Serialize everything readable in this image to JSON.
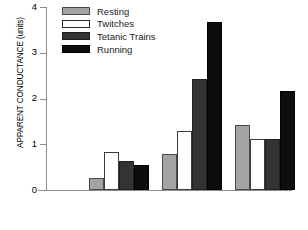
{
  "chart_data": {
    "type": "bar",
    "title": "",
    "xlabel": "",
    "ylabel": "APPARENT CONDUCTANCE (units)",
    "ylim": [
      0,
      4
    ],
    "yticks": [
      0,
      1,
      2,
      3,
      4
    ],
    "ytick_labels": [
      "0",
      "1",
      "2",
      "3",
      "4"
    ],
    "xtick_labels": [
      "",
      "",
      ""
    ],
    "grid": false,
    "legend_position": "top-center",
    "categories": [
      "Group 1",
      "Group 2",
      "Group 3"
    ],
    "series": [
      {
        "name": "Resting",
        "color": "#a3a3a3",
        "values": [
          0.26,
          0.79,
          1.43
        ]
      },
      {
        "name": "Twitches",
        "color": "#ffffff",
        "values": [
          0.83,
          1.29,
          1.12
        ]
      },
      {
        "name": "Tetanic Trains",
        "color": "#333333",
        "values": [
          0.63,
          2.43,
          1.11
        ]
      },
      {
        "name": "Running",
        "color": "#0d0d0d",
        "values": [
          0.55,
          3.68,
          2.17
        ]
      }
    ]
  },
  "axis": {
    "ylabel": "APPARENT CONDUCTANCE (units)",
    "ticks": [
      {
        "label": "4",
        "value": 4
      },
      {
        "label": "3",
        "value": 3
      },
      {
        "label": "2",
        "value": 2
      },
      {
        "label": "1",
        "value": 1
      },
      {
        "label": "0",
        "value": 0
      }
    ]
  },
  "legend": {
    "items": [
      {
        "label": "Resting",
        "key": "resting"
      },
      {
        "label": "Twitches",
        "key": "twitches"
      },
      {
        "label": "Tetanic Trains",
        "key": "tetanic"
      },
      {
        "label": "Running",
        "key": "running"
      }
    ]
  }
}
